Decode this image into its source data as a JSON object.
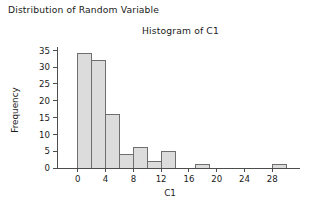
{
  "figure": {
    "main_title": "Distribution of Random Variable",
    "chart_title": "Histogram of C1"
  },
  "colors": {
    "bar_fill": "#dcdcdc",
    "bar_stroke": "#6e6e6e",
    "axis": "#4d4d4d",
    "text": "#1a1a1a",
    "background": "#ffffff"
  },
  "chart_data": {
    "type": "bar",
    "title": "Histogram of C1",
    "xlabel": "C1",
    "ylabel": "Frequency",
    "xlim": [
      -3,
      32
    ],
    "ylim": [
      0,
      36
    ],
    "xticks": [
      0,
      4,
      8,
      12,
      16,
      20,
      24,
      28
    ],
    "yticks": [
      0,
      5,
      10,
      15,
      20,
      25,
      30,
      35
    ],
    "grid": false,
    "legend": null,
    "bin_width": 2,
    "bin_starts": [
      -2,
      0,
      2,
      4,
      6,
      8,
      10,
      12,
      17,
      28
    ],
    "bin_ends": [
      0,
      2,
      4,
      6,
      8,
      10,
      12,
      14,
      19,
      30
    ],
    "categories": [
      "-2 to 0",
      "0 to 2",
      "2 to 4",
      "4 to 6",
      "6 to 8",
      "8 to 10",
      "10 to 12",
      "12 to 14",
      "17 to 19",
      "28 to 30"
    ],
    "values": [
      0,
      34,
      32,
      16,
      4,
      6,
      2,
      5,
      1,
      1
    ]
  }
}
